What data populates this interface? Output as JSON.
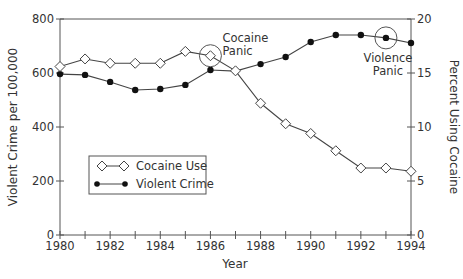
{
  "chart_data": {
    "type": "line",
    "title": "",
    "xlabel": "Year",
    "ylabel_left": "Violent Crime per 100,000",
    "ylabel_right": "Percent Using Cocaine",
    "x": [
      1980,
      1981,
      1982,
      1983,
      1984,
      1985,
      1986,
      1987,
      1988,
      1989,
      1990,
      1991,
      1992,
      1993,
      1994
    ],
    "x_ticks": [
      "1980",
      "1982",
      "1984",
      "1986",
      "1988",
      "1990",
      "1992",
      "1994"
    ],
    "ylim_left": [
      0,
      800
    ],
    "y_ticks_left": [
      "0",
      "200",
      "400",
      "600",
      "800"
    ],
    "ylim_right": [
      0,
      20
    ],
    "y_ticks_right": [
      "0",
      "5",
      "10",
      "15",
      "20"
    ],
    "grid": false,
    "legend_position": "lower-left inside",
    "series": [
      {
        "name": "Cocaine Use",
        "axis": "right",
        "marker": "open-diamond",
        "values": [
          15.6,
          16.3,
          15.9,
          15.9,
          15.9,
          17.0,
          16.6,
          15.2,
          12.2,
          10.3,
          9.4,
          7.8,
          6.2,
          6.2,
          5.9
        ]
      },
      {
        "name": "Violent Crime",
        "axis": "left",
        "marker": "filled-circle",
        "values": [
          596,
          593,
          567,
          537,
          541,
          556,
          611,
          607,
          633,
          659,
          715,
          741,
          741,
          730,
          711
        ]
      }
    ],
    "annotations": [
      {
        "text_lines": [
          "Cocaine",
          "Panic"
        ],
        "year": 1986,
        "series": "Cocaine Use"
      },
      {
        "text_lines": [
          "Violence",
          "Panic"
        ],
        "year": 1993,
        "series": "Violent Crime"
      }
    ]
  },
  "legend": {
    "items": [
      "Cocaine Use",
      "Violent Crime"
    ]
  },
  "colors": {
    "line": "#444444",
    "axis": "#555555",
    "text": "#333333"
  }
}
